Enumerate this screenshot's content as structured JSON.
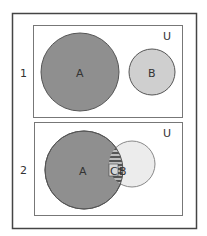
{
  "panels": [
    {
      "index_label": "1",
      "universe_label": "U",
      "set_a_label": "A",
      "set_b_label": "B"
    },
    {
      "index_label": "2",
      "universe_label": "U",
      "set_a_label": "A",
      "set_b_label": "B",
      "intersection_label": "C"
    }
  ],
  "colors": {
    "set_a": "#8f8f8f",
    "set_b_panel1": "#cfcfcf",
    "set_b_panel2": "#ececec",
    "border": "#444444",
    "inner_border": "#666666"
  }
}
